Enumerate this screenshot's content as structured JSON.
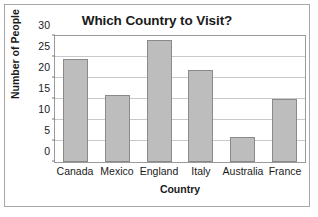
{
  "chart_data": {
    "type": "bar",
    "title": "Which Country to Visit?",
    "xlabel": "Country",
    "ylabel": "Number of People",
    "categories": [
      "Canada",
      "Mexico",
      "England",
      "Italy",
      "Australia",
      "France"
    ],
    "values": [
      24.5,
      16,
      29,
      22,
      6,
      15
    ],
    "ylim": [
      0,
      30
    ],
    "yticks": [
      0,
      5,
      10,
      15,
      20,
      25,
      30
    ],
    "ytick_labels": [
      "0",
      "5",
      "10",
      "15",
      "20",
      "25",
      "30"
    ],
    "grid": "horizontal",
    "legend": "none",
    "colors": {
      "bar_fill": "#bdbdbd",
      "bar_border": "#8a8a8a",
      "gridline": "#c9c9c9",
      "axis": "#9a9a9a",
      "text": "#1a1a1a",
      "frame": "#a8a8a8",
      "background": "#ffffff"
    }
  }
}
